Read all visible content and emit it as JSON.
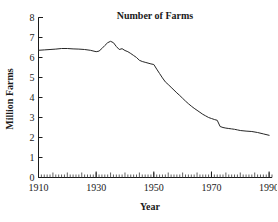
{
  "chart_data": {
    "type": "line",
    "title": "Number of Farms",
    "xlabel": "Year",
    "ylabel": "Million Farms",
    "xlim": [
      1910,
      1991
    ],
    "ylim": [
      0,
      8
    ],
    "grid": false,
    "legend": "none",
    "x_ticks": [
      1910,
      1930,
      1950,
      1970,
      1990
    ],
    "x_tick_labels": [
      "1910",
      "1930",
      "1950",
      "1970",
      "1990"
    ],
    "x_minor_tick_step": 1,
    "y_ticks": [
      0,
      1,
      2,
      3,
      4,
      5,
      6,
      7,
      8
    ],
    "y_tick_labels": [
      "0",
      "1",
      "2",
      "3",
      "4",
      "5",
      "6",
      "7",
      "8"
    ],
    "series": [
      {
        "name": "Number of Farms",
        "color": "#262626",
        "x": [
          1910,
          1912,
          1914,
          1916,
          1918,
          1920,
          1922,
          1924,
          1926,
          1928,
          1930,
          1931,
          1932,
          1933,
          1934,
          1935,
          1936,
          1937,
          1938,
          1939,
          1940,
          1941,
          1942,
          1943,
          1944,
          1945,
          1946,
          1947,
          1948,
          1949,
          1950,
          1951,
          1952,
          1953,
          1954,
          1955,
          1956,
          1957,
          1958,
          1959,
          1960,
          1961,
          1962,
          1963,
          1964,
          1965,
          1966,
          1967,
          1968,
          1969,
          1970,
          1971,
          1972,
          1973,
          1974,
          1975,
          1976,
          1977,
          1978,
          1979,
          1980,
          1982,
          1984,
          1986,
          1988,
          1990
        ],
        "y": [
          6.36,
          6.38,
          6.4,
          6.42,
          6.45,
          6.45,
          6.43,
          6.42,
          6.4,
          6.36,
          6.29,
          6.32,
          6.45,
          6.6,
          6.74,
          6.81,
          6.74,
          6.55,
          6.4,
          6.44,
          6.35,
          6.29,
          6.2,
          6.1,
          6.0,
          5.86,
          5.8,
          5.76,
          5.72,
          5.68,
          5.65,
          5.42,
          5.2,
          4.98,
          4.78,
          4.65,
          4.51,
          4.37,
          4.23,
          4.1,
          3.96,
          3.82,
          3.69,
          3.57,
          3.46,
          3.36,
          3.26,
          3.16,
          3.08,
          3.0,
          2.95,
          2.9,
          2.86,
          2.55,
          2.5,
          2.47,
          2.45,
          2.43,
          2.41,
          2.38,
          2.35,
          2.32,
          2.3,
          2.25,
          2.18,
          2.11
        ]
      }
    ]
  },
  "figure": {
    "title": "Number of Farms",
    "xlabel": "Year",
    "ylabel": "Million Farms"
  }
}
